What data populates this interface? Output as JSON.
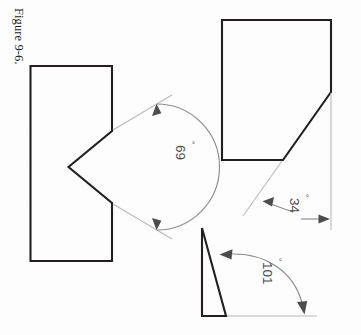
{
  "figure": {
    "caption": "Figure 9-6.",
    "orientation": "rotated-90-clockwise",
    "background_color": "#fdfdfd",
    "outline_color": "#231f20",
    "dimension_line_color": "#8d8d90",
    "extension_line_color": "#b9b9bb"
  },
  "shapes": [
    {
      "id": "notched-rectangle",
      "name": "notched-rectangle",
      "description": "Rectangle with a V-shaped notch cut into its right edge",
      "angle_label": "69",
      "angle_unit": "°",
      "angle_value": 69
    },
    {
      "id": "chamfered-rectangle",
      "name": "chamfered-rectangle",
      "description": "Rectangle with a chamfered corner",
      "angle_label": "34",
      "angle_unit": "°",
      "angle_value": 34
    },
    {
      "id": "narrow-triangle",
      "name": "narrow-triangle",
      "description": "Narrow right triangle with a baseline extension",
      "angle_label": "101",
      "angle_unit": "°",
      "angle_value": 101
    }
  ],
  "annotations": {
    "angle_69": {
      "text": "69",
      "degree": "°"
    },
    "angle_34": {
      "text": "34",
      "degree": "°"
    },
    "angle_101": {
      "text": "101",
      "degree": "°"
    }
  }
}
